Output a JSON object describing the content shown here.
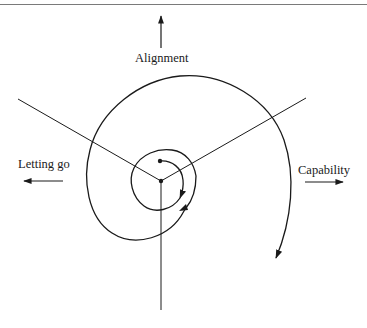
{
  "diagram": {
    "type": "spiral-growth-diagram",
    "axes": [
      {
        "id": "alignment",
        "label": "Alignment",
        "direction": "up"
      },
      {
        "id": "letting_go",
        "label": "Letting go",
        "direction": "left"
      },
      {
        "id": "capability",
        "label": "Capability",
        "direction": "right"
      }
    ],
    "spiral": {
      "direction": "clockwise",
      "start": "center (inner dot)",
      "arrowheads": 3
    },
    "stroke_color": "#1a1a1a",
    "rule_color": "#7a7a7a"
  }
}
